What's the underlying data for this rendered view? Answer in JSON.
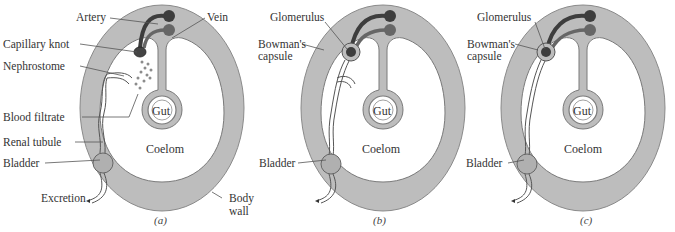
{
  "figure": {
    "colors": {
      "body_wall": "#bdbdbd",
      "coelom": "#ffffff",
      "outline": "#7a7a7a",
      "artery": "#3d3d3d",
      "vein": "#6e6e6e",
      "leader_line": "#555555"
    },
    "panels": [
      {
        "caption": "(a)",
        "labels": {
          "artery": "Artery",
          "vein": "Vein",
          "capillary_knot": "Capillary knot",
          "nephrostome": "Nephrostome",
          "blood_filtrate": "Blood filtrate",
          "renal_tubule": "Renal tubule",
          "bladder": "Bladder",
          "excretion": "Excretion",
          "gut": "Gut",
          "coelom": "Coelom",
          "body_wall_1": "Body",
          "body_wall_2": "wall"
        }
      },
      {
        "caption": "(b)",
        "labels": {
          "glomerulus": "Glomerulus",
          "bowmans_1": "Bowman's",
          "bowmans_2": "capsule",
          "bladder": "Bladder",
          "gut": "Gut",
          "coelom": "Coelom"
        }
      },
      {
        "caption": "(c)",
        "labels": {
          "glomerulus": "Glomerulus",
          "bowmans_1": "Bowman's",
          "bowmans_2": "capsule",
          "bladder": "Bladder",
          "gut": "Gut",
          "coelom": "Coelom"
        }
      }
    ]
  }
}
